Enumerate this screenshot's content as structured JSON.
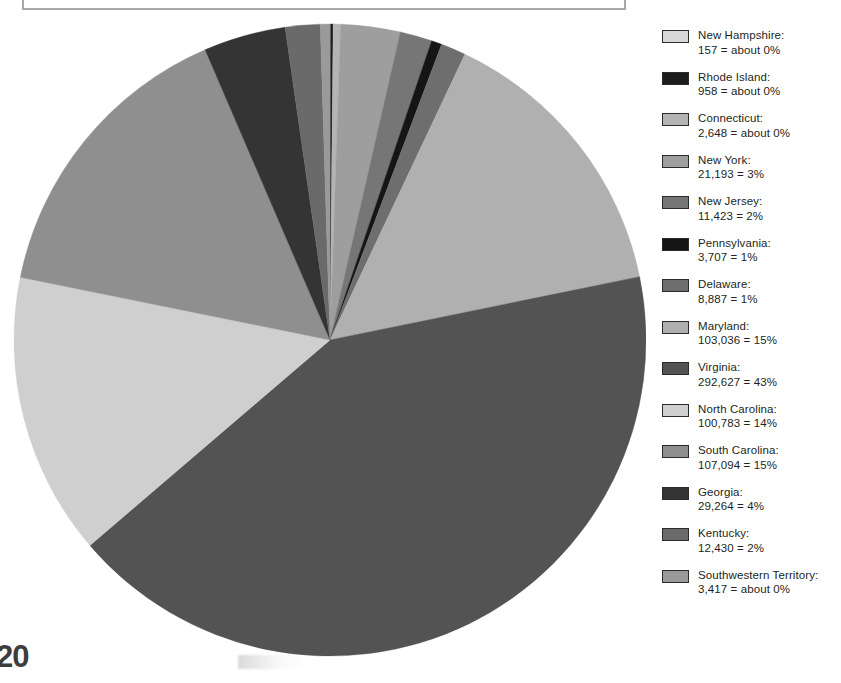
{
  "page": {
    "number": "20",
    "title": "",
    "background": "#ffffff"
  },
  "chart_data": {
    "type": "pie",
    "title": "",
    "xlabel": "",
    "ylabel": "",
    "legend_position": "right",
    "grid": false,
    "start_angle_deg": -90,
    "direction": "clockwise",
    "total": 698724,
    "categories": [
      "New Hampshire",
      "Rhode Island",
      "Connecticut",
      "New York",
      "New Jersey",
      "Pennsylvania",
      "Delaware",
      "Maryland",
      "Virginia",
      "North Carolina",
      "South Carolina",
      "Georgia",
      "Kentucky",
      "Southwestern Territory"
    ],
    "values": [
      157,
      958,
      2648,
      21193,
      11423,
      3707,
      8887,
      103036,
      292627,
      100783,
      107094,
      29264,
      12430,
      3417
    ],
    "percent_labels": [
      "about 0%",
      "about 0%",
      "about 0%",
      "3%",
      "2%",
      "1%",
      "1%",
      "15%",
      "43%",
      "14%",
      "15%",
      "4%",
      "2%",
      "about 0%"
    ],
    "value_labels": [
      "157",
      "958",
      "2,648",
      "21,193",
      "11,423",
      "3,707",
      "8,887",
      "103,036",
      "292,627",
      "100,783",
      "107,094",
      "29,264",
      "12,430",
      "3,417"
    ],
    "colors": [
      "#d8d8d8",
      "#1c1c1c",
      "#b4b4b4",
      "#9e9e9e",
      "#767676",
      "#151515",
      "#6e6e6e",
      "#b0b0b0",
      "#535353",
      "#cfcfcf",
      "#8f8f8f",
      "#343434",
      "#6a6a6a",
      "#9a9a9a"
    ]
  },
  "legend": {
    "items": [
      {
        "name": "New Hampshire:",
        "value": "157 = about 0%",
        "color": "#d8d8d8"
      },
      {
        "name": "Rhode Island:",
        "value": "958 = about 0%",
        "color": "#1c1c1c"
      },
      {
        "name": "Connecticut:",
        "value": "2,648 = about 0%",
        "color": "#b4b4b4"
      },
      {
        "name": "New York:",
        "value": "21,193 = 3%",
        "color": "#9e9e9e"
      },
      {
        "name": "New Jersey:",
        "value": "11,423 = 2%",
        "color": "#767676"
      },
      {
        "name": "Pennsylvania:",
        "value": "3,707 = 1%",
        "color": "#151515"
      },
      {
        "name": "Delaware:",
        "value": "8,887 = 1%",
        "color": "#6e6e6e"
      },
      {
        "name": "Maryland:",
        "value": "103,036 = 15%",
        "color": "#b0b0b0"
      },
      {
        "name": "Virginia:",
        "value": "292,627 = 43%",
        "color": "#535353"
      },
      {
        "name": "North Carolina:",
        "value": "100,783 = 14%",
        "color": "#cfcfcf"
      },
      {
        "name": "South Carolina:",
        "value": "107,094 = 15%",
        "color": "#8f8f8f"
      },
      {
        "name": "Georgia:",
        "value": "29,264 = 4%",
        "color": "#343434"
      },
      {
        "name": "Kentucky:",
        "value": "12,430 = 2%",
        "color": "#6a6a6a"
      },
      {
        "name": "Southwestern Territory:",
        "value": "3,417 =  about 0%",
        "color": "#9a9a9a"
      }
    ]
  }
}
